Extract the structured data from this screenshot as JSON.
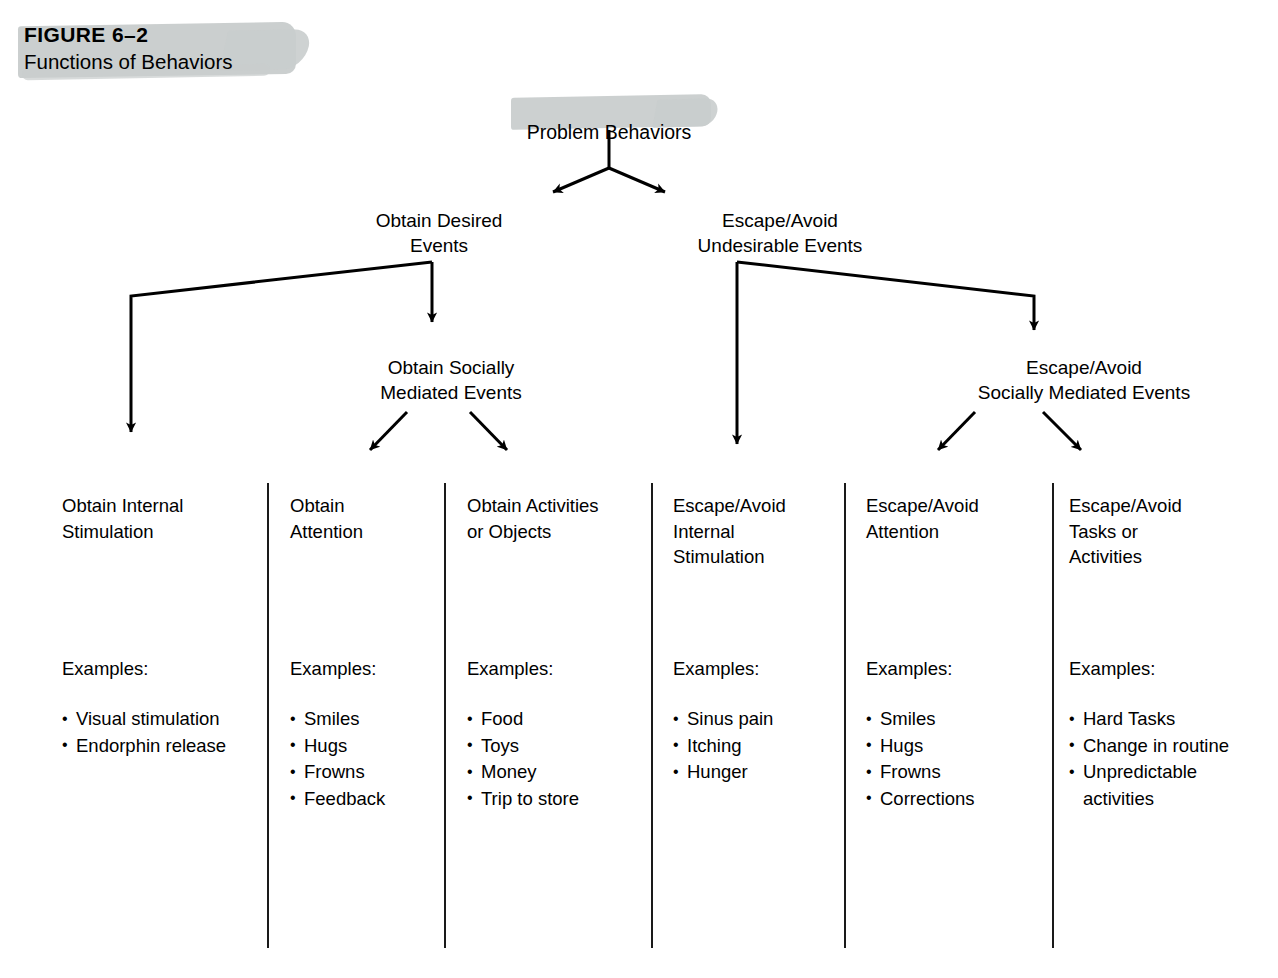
{
  "figure": {
    "number": "FIGURE 6–2",
    "title": "Functions of Behaviors"
  },
  "diagram": {
    "root": "Problem Behaviors",
    "level2": [
      {
        "id": "obtain-desired",
        "label": "Obtain Desired\nEvents"
      },
      {
        "id": "escape-avoid",
        "label": "Escape/Avoid\nUndesirable Events"
      }
    ],
    "level3": [
      {
        "id": "obtain-social",
        "label": "Obtain Socially\nMediated Events"
      },
      {
        "id": "escape-social",
        "label": "Escape/Avoid\nSocially Mediated Events"
      }
    ],
    "examples_label": "Examples:",
    "columns": [
      {
        "id": "obtain-internal-stimulation",
        "title": "Obtain Internal\nStimulation",
        "examples_label": "Examples:",
        "examples": [
          "Visual stimulation",
          "Endorphin release"
        ]
      },
      {
        "id": "obtain-attention",
        "title": "Obtain\nAttention",
        "examples_label": "Examples:",
        "examples": [
          "Smiles",
          "Hugs",
          "Frowns",
          "Feedback"
        ]
      },
      {
        "id": "obtain-activities-or-objects",
        "title": "Obtain Activities\nor Objects",
        "examples_label": "Examples:",
        "examples": [
          "Food",
          "Toys",
          "Money",
          "Trip to store"
        ]
      },
      {
        "id": "escape-avoid-internal-stimulation",
        "title": "Escape/Avoid\nInternal\nStimulation",
        "examples_label": "Examples:",
        "examples": [
          "Sinus pain",
          "Itching",
          "Hunger"
        ]
      },
      {
        "id": "escape-avoid-attention",
        "title": "Escape/Avoid\nAttention",
        "examples_label": "Examples:",
        "examples": [
          "Smiles",
          "Hugs",
          "Frowns",
          "Corrections"
        ]
      },
      {
        "id": "escape-avoid-tasks-or-activities",
        "title": "Escape/Avoid\nTasks or\nActivities",
        "examples_label": "Examples:",
        "examples": [
          "Hard Tasks",
          "Change in routine",
          "Unpredictable\nactivities"
        ]
      }
    ]
  },
  "colors": {
    "highlight": "#c9cdcd",
    "ink": "#000000",
    "rule": "#1a1a1a",
    "background": "#ffffff"
  }
}
